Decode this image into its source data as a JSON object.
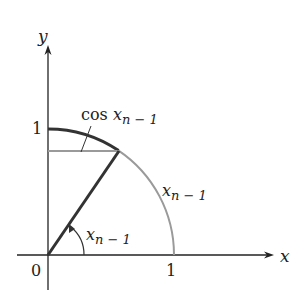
{
  "diagram": {
    "axes": {
      "x_label": "x",
      "y_label": "y",
      "origin_label": "0",
      "x_tick_label": "1",
      "y_tick_label": "1"
    },
    "labels": {
      "cos_label_prefix": "cos ",
      "cos_label_var": "x",
      "cos_label_sub": "n − 1",
      "arc_label_var": "x",
      "arc_label_sub": "n − 1",
      "angle_label_var": "x",
      "angle_label_sub": "n − 1"
    },
    "colors": {
      "axis": "#222222",
      "radius": "#333333",
      "arc_upper": "#333333",
      "arc_lower": "#999999",
      "horizontal_segment": "#999999"
    }
  }
}
